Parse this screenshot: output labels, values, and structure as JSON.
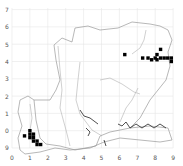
{
  "map": {
    "type": "distribution grid map",
    "x_ticks": [
      "0",
      "1",
      "2",
      "3",
      "4",
      "5",
      "6",
      "7",
      "8",
      "9"
    ],
    "y_ticks": [
      "7",
      "6",
      "5",
      "4",
      "3",
      "2",
      "1",
      "0",
      "9"
    ],
    "colors": {
      "grid": "#e6e6e6",
      "outline": "#9a9a9a",
      "river": "#b0b0b0",
      "record": "#000000",
      "text": "#555555"
    },
    "records": [
      {
        "x": 6.3,
        "y": 5.4
      },
      {
        "x": 7.3,
        "y": 5.2
      },
      {
        "x": 7.6,
        "y": 5.2
      },
      {
        "x": 7.8,
        "y": 5.1
      },
      {
        "x": 8.0,
        "y": 5.2
      },
      {
        "x": 8.1,
        "y": 5.1
      },
      {
        "x": 8.3,
        "y": 5.2
      },
      {
        "x": 8.5,
        "y": 5.2
      },
      {
        "x": 8.7,
        "y": 5.2
      },
      {
        "x": 8.9,
        "y": 5.2
      },
      {
        "x": 8.9,
        "y": 5.0
      },
      {
        "x": 8.3,
        "y": 5.7
      },
      {
        "x": 8.1,
        "y": 5.4
      },
      {
        "x": 0.7,
        "y": 0.7
      },
      {
        "x": 1.0,
        "y": 1.0
      },
      {
        "x": 1.0,
        "y": 0.8
      },
      {
        "x": 1.2,
        "y": 0.8
      },
      {
        "x": 1.2,
        "y": 0.6
      },
      {
        "x": 1.2,
        "y": 0.4
      },
      {
        "x": 1.4,
        "y": 0.4
      },
      {
        "x": 1.4,
        "y": 0.2
      },
      {
        "x": 1.6,
        "y": 0.2
      },
      {
        "x": 1.0,
        "y": 0.6
      }
    ]
  }
}
